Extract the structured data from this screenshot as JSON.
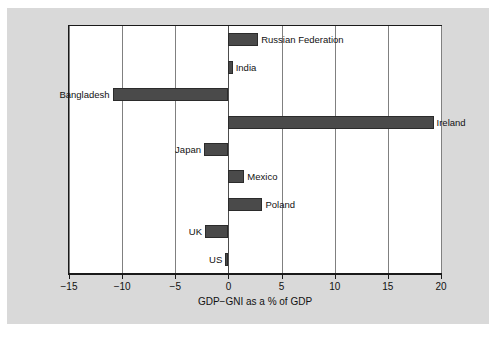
{
  "chart_data": {
    "type": "bar",
    "orientation": "horizontal",
    "title": "",
    "xlabel": "GDP−GNI as a % of GDP",
    "ylabel": "",
    "xlim": [
      -15,
      20
    ],
    "xticks": [
      -15,
      -10,
      -5,
      0,
      5,
      10,
      15,
      20
    ],
    "xtick_labels": [
      "−15",
      "−10",
      "−5",
      "0",
      "5",
      "10",
      "15",
      "20"
    ],
    "grid": "vertical",
    "legend": "none",
    "bar_color": "#4a4a4a",
    "categories": [
      "Russian Federation",
      "India",
      "Bangladesh",
      "Ireland",
      "Japan",
      "Mexico",
      "Poland",
      "UK",
      "US"
    ],
    "values": [
      2.8,
      0.4,
      -10.9,
      19.3,
      -2.3,
      1.5,
      3.2,
      -2.2,
      -0.3
    ]
  },
  "footnote": {
    "text": ""
  }
}
